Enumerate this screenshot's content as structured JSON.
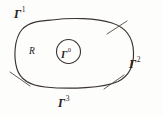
{
  "figure": {
    "type": "math-diagram",
    "background_color": "#fdfdfc",
    "stroke_color": "#3a3330",
    "text_color": "#26211e",
    "width": 163,
    "height": 116
  },
  "labels": {
    "region": {
      "text": "R",
      "name": "region-interior-label"
    },
    "inner_boundary": {
      "base": "Γ",
      "superscript": "0",
      "name": "inner-boundary-label"
    },
    "outer_boundary_top": {
      "base": "Γ",
      "superscript": "1",
      "name": "outer-boundary-label-top"
    },
    "outer_boundary_right": {
      "base": "Γ",
      "superscript": "2",
      "name": "outer-boundary-label-right"
    },
    "outer_boundary_bottom": {
      "base": "Γ",
      "superscript": "3",
      "name": "outer-boundary-label-bottom"
    }
  },
  "shapes": {
    "outer_curve": {
      "name": "outer-boundary-curve",
      "kind": "closed-rounded-blob",
      "path": "M 52 20 C 72 17.5, 96 18, 112 23 C 126 27.5, 133 38, 133.5 52 C 134 65, 129 76, 118 81.5 C 104 88, 70 89.5, 45 87 C 30 85.5, 20.5 80, 17 69 C 13.5 57.5, 14 39, 22 29.5 C 29 21.5, 40 21, 52 20 Z"
    },
    "inner_circle": {
      "name": "inner-boundary-circle",
      "cx": 68.5,
      "cy": 51.5,
      "r": 12.0
    },
    "tick_marks": [
      {
        "name": "tick-mark-upper-right",
        "x1": 107,
        "y1": 34,
        "x2": 127,
        "y2": 21
      },
      {
        "name": "tick-mark-lower-right",
        "x1": 104,
        "y1": 89,
        "x2": 124,
        "y2": 75
      },
      {
        "name": "tick-mark-lower-left",
        "x1": 10,
        "y1": 72,
        "x2": 30,
        "y2": 86
      }
    ]
  }
}
